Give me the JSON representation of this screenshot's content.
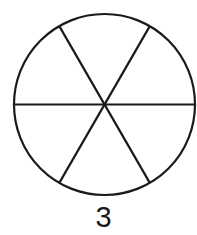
{
  "figure": {
    "shape": "circle",
    "divisions": 6,
    "stroke_color": "#1a1a1a",
    "fill_color": "#ffffff",
    "label": "3"
  }
}
